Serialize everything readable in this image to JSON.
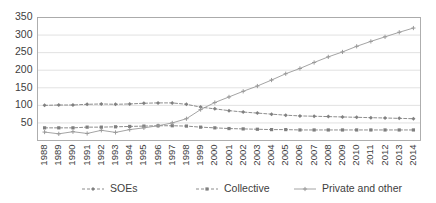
{
  "chart_data": {
    "type": "line",
    "title": "",
    "subtitle": "",
    "xlabel": "",
    "ylabel": "",
    "x": [
      1988,
      1989,
      1990,
      1991,
      1992,
      1993,
      1994,
      1995,
      1996,
      1997,
      1998,
      1999,
      2000,
      2001,
      2002,
      2003,
      2004,
      2005,
      2006,
      2007,
      2008,
      2009,
      2010,
      2011,
      2012,
      2013,
      2014
    ],
    "categories": [
      "1988",
      "1989",
      "1990",
      "1991",
      "1992",
      "1993",
      "1994",
      "1995",
      "1996",
      "1997",
      "1998",
      "1999",
      "2000",
      "2001",
      "2002",
      "2003",
      "2004",
      "2005",
      "2006",
      "2007",
      "2008",
      "2009",
      "2010",
      "2011",
      "2012",
      "2013",
      "2014"
    ],
    "series": [
      {
        "name": "SOEs",
        "style": "dashed",
        "marker": "diamond",
        "color": "#808080",
        "values": [
          100,
          101,
          101,
          103,
          104,
          103,
          104,
          106,
          107,
          107,
          103,
          95,
          90,
          85,
          81,
          78,
          75,
          72,
          70,
          69,
          68,
          67,
          66,
          65,
          64,
          63,
          62
        ]
      },
      {
        "name": "Collective",
        "style": "dashed",
        "marker": "square",
        "color": "#7f7f7f",
        "values": [
          36,
          36,
          36,
          38,
          38,
          39,
          40,
          41,
          42,
          42,
          41,
          38,
          36,
          34,
          33,
          32,
          31,
          31,
          30,
          30,
          30,
          30,
          30,
          30,
          30,
          30,
          30
        ]
      },
      {
        "name": "Private and other",
        "style": "solid",
        "marker": "plus",
        "color": "#9a9a9a",
        "values": [
          24,
          19,
          25,
          20,
          29,
          23,
          31,
          36,
          42,
          50,
          62,
          88,
          108,
          124,
          140,
          155,
          172,
          190,
          205,
          222,
          238,
          252,
          268,
          282,
          295,
          308,
          320
        ]
      }
    ],
    "yticks": [
      50,
      100,
      150,
      200,
      250,
      300,
      350
    ],
    "ylim": [
      0,
      350
    ],
    "grid": true,
    "legend_position": "bottom"
  },
  "legend": {
    "items": [
      {
        "label": "SOEs"
      },
      {
        "label": "Collective"
      },
      {
        "label": "Private and other"
      }
    ]
  }
}
